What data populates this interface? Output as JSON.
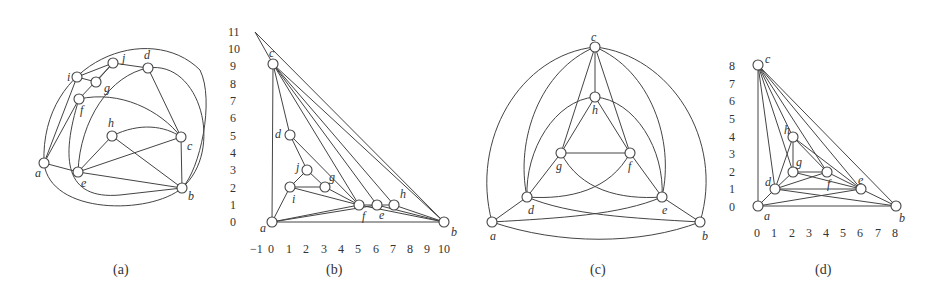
{
  "figure": {
    "captions": [
      "(a)",
      "(b)",
      "(c)",
      "(d)"
    ],
    "panel_a": {
      "caption": "(a)",
      "nodes": [
        {
          "id": "a",
          "label": "a"
        },
        {
          "id": "b",
          "label": "b"
        },
        {
          "id": "c",
          "label": "c"
        },
        {
          "id": "d",
          "label": "d"
        },
        {
          "id": "e",
          "label": "e"
        },
        {
          "id": "f",
          "label": "f"
        },
        {
          "id": "g",
          "label": "g"
        },
        {
          "id": "h",
          "label": "h"
        },
        {
          "id": "i",
          "label": "i"
        },
        {
          "id": "j",
          "label": "j"
        }
      ]
    },
    "panel_b": {
      "caption": "(b)",
      "x_ticks": [
        "−1",
        "0",
        "1",
        "2",
        "3",
        "4",
        "5",
        "6",
        "7",
        "8",
        "9",
        "10"
      ],
      "y_ticks": [
        "0",
        "1",
        "2",
        "3",
        "4",
        "5",
        "6",
        "7",
        "8",
        "9",
        "10",
        "11"
      ],
      "nodes": [
        {
          "id": "a",
          "label": "a",
          "x": 0,
          "y": 0
        },
        {
          "id": "b",
          "label": "b",
          "x": 10,
          "y": 0
        },
        {
          "id": "c",
          "label": "c",
          "x": 0,
          "y": 9
        },
        {
          "id": "d",
          "label": "d",
          "x": 1,
          "y": 5
        },
        {
          "id": "e",
          "label": "e",
          "x": 6,
          "y": 1
        },
        {
          "id": "f",
          "label": "f",
          "x": 5,
          "y": 1
        },
        {
          "id": "g",
          "label": "g",
          "x": 3,
          "y": 2
        },
        {
          "id": "h",
          "label": "h",
          "x": 7,
          "y": 1
        },
        {
          "id": "i",
          "label": "i",
          "x": 1,
          "y": 2
        },
        {
          "id": "j",
          "label": "j",
          "x": 2,
          "y": 3
        }
      ]
    },
    "panel_c": {
      "caption": "(c)",
      "nodes": [
        {
          "id": "a",
          "label": "a"
        },
        {
          "id": "b",
          "label": "b"
        },
        {
          "id": "c",
          "label": "c"
        },
        {
          "id": "d",
          "label": "d"
        },
        {
          "id": "e",
          "label": "e"
        },
        {
          "id": "f",
          "label": "f"
        },
        {
          "id": "g",
          "label": "g"
        },
        {
          "id": "h",
          "label": "h"
        }
      ]
    },
    "panel_d": {
      "caption": "(d)",
      "x_ticks": [
        "0",
        "1",
        "2",
        "3",
        "4",
        "5",
        "6",
        "7",
        "8"
      ],
      "y_ticks": [
        "0",
        "1",
        "2",
        "3",
        "4",
        "5",
        "6",
        "7",
        "8"
      ],
      "nodes": [
        {
          "id": "a",
          "label": "a",
          "x": 0,
          "y": 0
        },
        {
          "id": "b",
          "label": "b",
          "x": 8,
          "y": 0
        },
        {
          "id": "c",
          "label": "c",
          "x": 0,
          "y": 8
        },
        {
          "id": "d",
          "label": "d",
          "x": 1,
          "y": 1
        },
        {
          "id": "e",
          "label": "e",
          "x": 6,
          "y": 1
        },
        {
          "id": "f",
          "label": "f",
          "x": 4,
          "y": 2
        },
        {
          "id": "g",
          "label": "g",
          "x": 2,
          "y": 2
        },
        {
          "id": "h",
          "label": "h",
          "x": 2,
          "y": 4
        }
      ]
    }
  }
}
